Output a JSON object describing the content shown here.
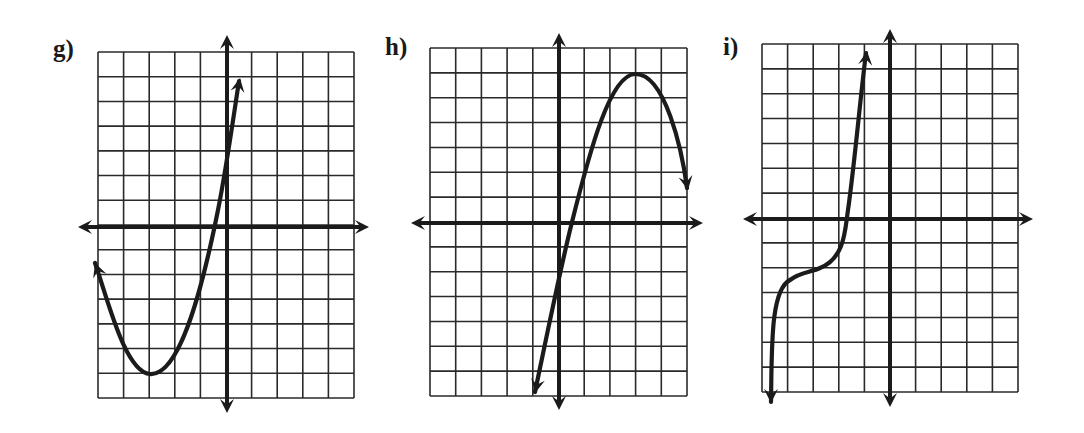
{
  "chart_data": [
    {
      "type": "line",
      "label": "g)",
      "title": "",
      "xlabel": "",
      "ylabel": "",
      "grid": true,
      "grid_cols": 10,
      "grid_rows": 14,
      "xlim": [
        -5,
        5
      ],
      "ylim": [
        -7,
        7
      ],
      "axes_arrows": true,
      "description": "Upward-opening parabola, vertex near (-3, -6), arrows at both ends",
      "x": [
        -5.2,
        -4.5,
        -4,
        -3.5,
        -3,
        -2.5,
        -2,
        -1.5,
        -1,
        -0.6,
        0,
        0.3,
        0.5
      ],
      "y": [
        -1.5,
        -3.75,
        -5,
        -5.75,
        -6,
        -5.75,
        -5,
        -3.75,
        -2,
        -0.2,
        3,
        4.8,
        5.9
      ]
    },
    {
      "type": "line",
      "label": "h)",
      "title": "",
      "xlabel": "",
      "ylabel": "",
      "grid": true,
      "grid_cols": 10,
      "grid_rows": 14,
      "xlim": [
        -5,
        5
      ],
      "ylim": [
        -7,
        7
      ],
      "axes_arrows": true,
      "description": "Rises steeply from lower left through (0.5, 0), peaks near (3, 6), then falls to the right",
      "x": [
        -0.9,
        -0.5,
        0,
        0.5,
        1,
        1.5,
        2,
        2.5,
        3,
        3.5,
        4,
        4.5,
        5
      ],
      "y": [
        -6.8,
        -4.6,
        -2,
        0,
        2.3,
        4,
        5.2,
        5.8,
        6,
        5.8,
        4.9,
        3.5,
        1.4
      ]
    },
    {
      "type": "line",
      "label": "i)",
      "title": "",
      "xlabel": "",
      "ylabel": "",
      "grid": true,
      "grid_cols": 10,
      "grid_rows": 14,
      "xlim": [
        -5,
        5
      ],
      "ylim": [
        -7,
        7
      ],
      "axes_arrows": true,
      "description": "Cubic-shaped increasing curve, inflection near (-3, -2), arrows at both ends",
      "x": [
        -4.6,
        -4.4,
        -4.2,
        -4,
        -3.5,
        -3,
        -2.5,
        -2,
        -1.7,
        -1.5,
        -1.2,
        -0.9
      ],
      "y": [
        -7.3,
        -5.5,
        -4.2,
        -3.3,
        -2.4,
        -2,
        -1.6,
        -0.7,
        0.4,
        1.7,
        4,
        6.6
      ]
    }
  ],
  "panels": [
    {
      "label": "g)",
      "label_pos": [
        53,
        38
      ],
      "grid": {
        "left": 98,
        "top": 52,
        "right": 354,
        "bottom": 398,
        "cols": 10,
        "rows": 14
      },
      "origin": [
        227,
        227
      ],
      "arrows": {
        "up": 35,
        "down": 413,
        "left": 78,
        "right": 369
      },
      "curve_px": "M95,263 C108,300 125,372 150,374 C178,376 200,300 218,210 C226,170 233,120 239,81",
      "curve_start_tip": [
        95,
        263
      ],
      "curve_start_from": [
        103,
        285
      ],
      "curve_end_tip": [
        240,
        78
      ],
      "curve_end_from": [
        236,
        100
      ]
    },
    {
      "label": "h)",
      "label_pos": [
        385,
        36
      ],
      "grid": {
        "left": 430,
        "top": 48,
        "right": 687,
        "bottom": 396,
        "cols": 10,
        "rows": 14
      },
      "origin": [
        559,
        223
      ],
      "arrows": {
        "up": 33,
        "down": 410,
        "left": 411,
        "right": 703
      },
      "curve_px": "M535,392 C548,330 560,270 572,222 C590,150 610,75 635,74 C665,73 682,150 687,188",
      "curve_start_tip": [
        535,
        393
      ],
      "curve_start_from": [
        540,
        370
      ],
      "curve_end_tip": [
        688,
        190
      ],
      "curve_end_from": [
        684,
        168
      ]
    },
    {
      "label": "i)",
      "label_pos": [
        723,
        36
      ],
      "grid": {
        "left": 762,
        "top": 44,
        "right": 1018,
        "bottom": 392,
        "cols": 10,
        "rows": 14
      },
      "origin": [
        890,
        219
      ],
      "arrows": {
        "up": 29,
        "down": 407,
        "left": 743,
        "right": 1033
      },
      "curve_px": "M771,402 C772,350 770,290 790,280 C800,272 812,272 820,268 C845,258 845,230 848,210 C855,160 860,100 866,53",
      "curve_start_tip": [
        771,
        403
      ],
      "curve_start_from": [
        771,
        380
      ],
      "curve_end_tip": [
        867,
        51
      ],
      "curve_end_from": [
        864,
        75
      ]
    }
  ],
  "style": {
    "ink": "#1b1b1b",
    "grid": "#2a2a2a",
    "background": "#ffffff"
  }
}
